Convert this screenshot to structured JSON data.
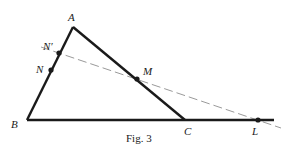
{
  "figure": {
    "caption": "Fig. 3",
    "points": {
      "A": {
        "label": "A",
        "x": 73,
        "y": 27
      },
      "B": {
        "label": "B",
        "x": 27,
        "y": 120
      },
      "C": {
        "label": "C",
        "x": 185,
        "y": 120
      },
      "N_prime": {
        "label": "N′",
        "x": 59,
        "y": 53
      },
      "N": {
        "label": "N",
        "x": 51,
        "y": 70
      },
      "M": {
        "label": "M",
        "x": 137,
        "y": 79
      },
      "L": {
        "label": "L",
        "x": 258,
        "y": 120
      }
    },
    "colors": {
      "stroke": "#1a1a1a",
      "dashed": "#9a9a9a"
    }
  }
}
